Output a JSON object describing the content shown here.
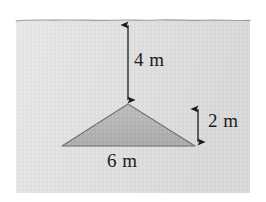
{
  "figure": {
    "medium": "water",
    "colors": {
      "page_background": "#ffffff",
      "water_fill": "#e2e2e2",
      "water_fill_dark": "#d2d2d2",
      "surface_line": "#9a9a9a",
      "shape_fill": "#b4b4b4",
      "shape_stroke": "#6f6f6f",
      "annotation": "#1c1c1c",
      "text": "#1c1c1c"
    },
    "surface": {
      "name": "water-surface-line",
      "style": "wavy",
      "y": 20
    },
    "shape": {
      "name": "triangle-plate",
      "type": "triangle",
      "apex": [
        128,
        104
      ],
      "base_left": [
        62,
        146
      ],
      "base_right": [
        195,
        146
      ],
      "base_length_m": 6,
      "height_m": 2
    },
    "dimensions": [
      {
        "id": "depth",
        "name": "depth-to-apex",
        "label": "4 m",
        "value": 4,
        "unit": "m",
        "orientation": "vertical",
        "arrow": "double",
        "from": [
          128,
          21
        ],
        "to": [
          128,
          103
        ]
      },
      {
        "id": "height",
        "name": "triangle-height",
        "label": "2 m",
        "value": 2,
        "unit": "m",
        "orientation": "vertical",
        "arrow": "double",
        "from": [
          198,
          105
        ],
        "to": [
          198,
          146
        ]
      },
      {
        "id": "base",
        "name": "triangle-base",
        "label": "6 m",
        "value": 6,
        "unit": "m",
        "orientation": "horizontal",
        "arrow": "none",
        "from": [
          62,
          146
        ],
        "to": [
          195,
          146
        ]
      }
    ]
  }
}
